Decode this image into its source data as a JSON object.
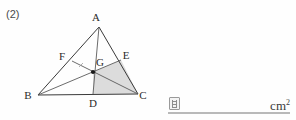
{
  "problem": {
    "number_label": "(2)"
  },
  "figure": {
    "type": "geometry-triangle-diagram",
    "points": {
      "A": {
        "label": "A",
        "x": 99,
        "y": 27,
        "label_x": 96,
        "label_y": 21
      },
      "B": {
        "label": "B",
        "x": 38,
        "y": 95,
        "label_x": 26,
        "label_y": 99
      },
      "C": {
        "label": "C",
        "x": 138,
        "y": 94,
        "label_x": 140,
        "label_y": 99
      },
      "D": {
        "label": "D",
        "x": 93,
        "y": 94,
        "label_x": 90,
        "label_y": 107
      },
      "E": {
        "label": "E",
        "x": 121,
        "y": 60,
        "label_x": 123,
        "label_y": 59
      },
      "F": {
        "label": "F",
        "x": 72,
        "y": 61,
        "label_x": 60,
        "label_y": 60
      },
      "G": {
        "label": "G",
        "x": 93,
        "y": 72,
        "label_x": 97,
        "label_y": 66
      }
    },
    "segments": [
      {
        "name": "side-AB",
        "from": "A",
        "to": "B"
      },
      {
        "name": "side-AC",
        "from": "A",
        "to": "C"
      },
      {
        "name": "side-BC",
        "from": "B",
        "to": "C"
      },
      {
        "name": "cevian-AD",
        "from": "A",
        "to": "D"
      },
      {
        "name": "cevian-BE",
        "from": "B",
        "to": "E"
      },
      {
        "name": "cevian-CF",
        "from": "C",
        "to": "F"
      }
    ],
    "shaded_region": {
      "name": "quadrilateral-GECD",
      "vertices": [
        "G",
        "E",
        "C",
        "D"
      ],
      "fill": "#dcdcdc"
    },
    "tick_mark": {
      "name": "segment-tick-FG",
      "x1": 79,
      "y1": 66,
      "x2": 83,
      "y2": 64
    },
    "centroid_dot": {
      "name": "point-G-dot",
      "x": 93,
      "y": 72,
      "r": 2.1
    },
    "stroke_color": "#3a3a3a"
  },
  "answer": {
    "icon_name": "answer-box-icon",
    "value": "",
    "unit_text": "cm",
    "unit_exponent": "2"
  }
}
